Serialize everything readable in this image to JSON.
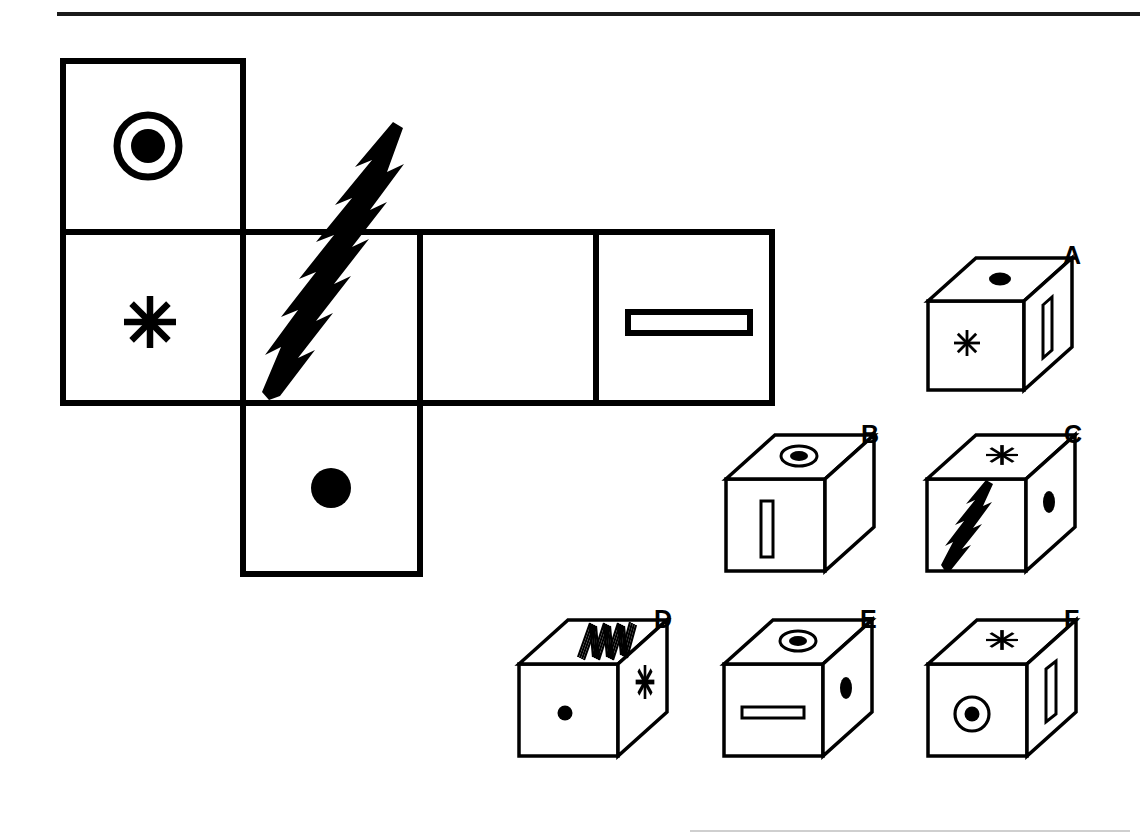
{
  "page": {
    "background_color": "#ffffff",
    "ink_color": "#000000",
    "width": 1140,
    "height": 839
  },
  "rules": {
    "top_rule": "horizontal-rule",
    "bottom_rule": "horizontal-rule-faint"
  },
  "net": {
    "description": "Unfolded cube net with six square faces",
    "faces": [
      {
        "id": "net-face-ringed-dot",
        "symbol": "ringed-dot",
        "symbol_label": "circle with filled center",
        "row": 1,
        "col": 1
      },
      {
        "id": "net-face-asterisk",
        "symbol": "asterisk",
        "symbol_label": "eight-point asterisk",
        "row": 2,
        "col": 1
      },
      {
        "id": "net-face-zigzag",
        "symbol": "zigzag",
        "symbol_label": "diagonal lightning zigzag",
        "row": 2,
        "col": 2
      },
      {
        "id": "net-face-blank",
        "symbol": "blank",
        "symbol_label": "empty face",
        "row": 2,
        "col": 3
      },
      {
        "id": "net-face-bar",
        "symbol": "horizontal-bar",
        "symbol_label": "outlined horizontal bar",
        "row": 2,
        "col": 4
      },
      {
        "id": "net-face-dot",
        "symbol": "solid-dot",
        "symbol_label": "filled circle",
        "row": 3,
        "col": 2
      }
    ]
  },
  "options": [
    {
      "label": "A",
      "name": "cube-option-a",
      "faces": {
        "top": "solid-dot",
        "front": "asterisk",
        "right": "vertical-bar"
      }
    },
    {
      "label": "B",
      "name": "cube-option-b",
      "faces": {
        "top": "ringed-dot",
        "front": "vertical-bar",
        "right": "blank"
      }
    },
    {
      "label": "C",
      "name": "cube-option-c",
      "faces": {
        "top": "asterisk",
        "front": "zigzag",
        "right": "solid-dot"
      }
    },
    {
      "label": "D",
      "name": "cube-option-d",
      "faces": {
        "top": "zigzag",
        "front": "solid-dot",
        "right": "asterisk"
      }
    },
    {
      "label": "E",
      "name": "cube-option-e",
      "faces": {
        "top": "ringed-dot",
        "front": "horizontal-bar",
        "right": "solid-dot"
      }
    },
    {
      "label": "F",
      "name": "cube-option-f",
      "faces": {
        "top": "asterisk",
        "front": "ringed-dot",
        "right": "vertical-bar"
      }
    }
  ],
  "labels": {
    "a": "A",
    "b": "B",
    "c": "C",
    "d": "D",
    "e": "E",
    "f": "F"
  }
}
